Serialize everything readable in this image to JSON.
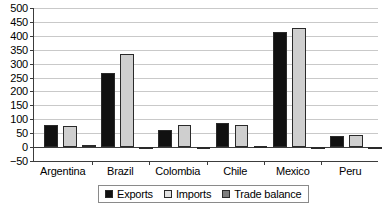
{
  "chart_data": {
    "type": "bar",
    "title": "",
    "subtitle": "",
    "xlabel": "",
    "ylabel": "",
    "categories": [
      "Argentina",
      "Brazil",
      "Colombia",
      "Chile",
      "Mexico",
      "Peru"
    ],
    "series": [
      {
        "name": "Exports",
        "color": "#111111",
        "values": [
          80,
          268,
          60,
          85,
          415,
          41
        ]
      },
      {
        "name": "Imports",
        "color": "#cfcfcf",
        "values": [
          77,
          336,
          81,
          81,
          429,
          44
        ]
      },
      {
        "name": "Trade balance",
        "color": "#7d7d7d",
        "values": [
          8,
          -4,
          -3,
          5,
          -3,
          -1
        ]
      }
    ],
    "ylim": [
      -50,
      500
    ],
    "ytick_step": 50,
    "ytick_labels": [
      "500",
      "450",
      "400",
      "350",
      "300",
      "250",
      "200",
      "150",
      "100",
      "50",
      "0",
      "−50"
    ],
    "ytick_values": [
      500,
      450,
      400,
      350,
      300,
      250,
      200,
      150,
      100,
      50,
      0,
      -50
    ],
    "grid": true,
    "grid_axis": "y",
    "legend_position": "bottom",
    "legend_entries": [
      "Exports",
      "Imports",
      "Trade balance"
    ]
  }
}
